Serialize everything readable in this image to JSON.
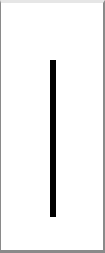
{
  "glyph": {
    "name": "vertical-bar",
    "color": "#000000"
  },
  "frame": {
    "background": "#ffffff",
    "border_color": "#8a8a8a"
  }
}
